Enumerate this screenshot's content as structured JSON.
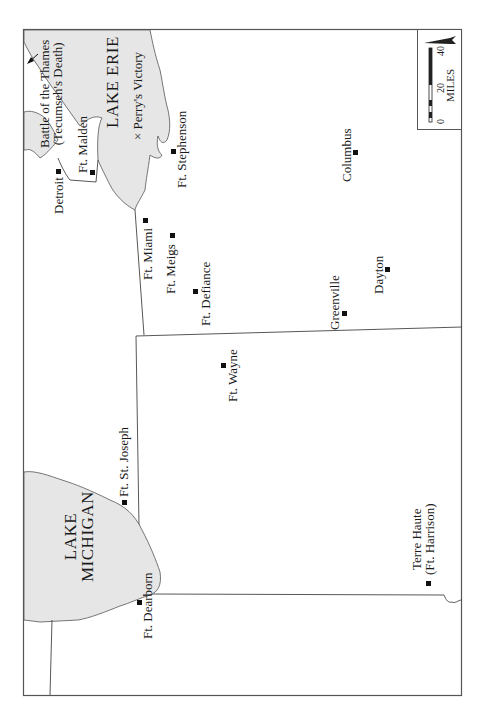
{
  "map": {
    "title": "War of 1812 - Northwest Theater",
    "colors": {
      "water": "#e6e6e6",
      "lines": "#444444",
      "frame": "#555555",
      "marker": "#111111"
    },
    "lakes": [
      {
        "id": "lake-erie",
        "label": "LAKE ERIE"
      },
      {
        "id": "lake-michigan",
        "label_line1": "LAKE",
        "label_line2": "MICHIGAN"
      }
    ],
    "places": [
      {
        "id": "detroit",
        "label": "Detroit"
      },
      {
        "id": "ft-malden",
        "label": "Ft. Malden"
      },
      {
        "id": "ft-stephenson",
        "label": "Ft. Stephenson"
      },
      {
        "id": "columbus",
        "label": "Columbus"
      },
      {
        "id": "ft-miami",
        "label": "Ft. Miami"
      },
      {
        "id": "ft-meigs",
        "label": "Ft. Meigs"
      },
      {
        "id": "ft-defiance",
        "label": "Ft. Defiance"
      },
      {
        "id": "greenville",
        "label": "Greenville"
      },
      {
        "id": "dayton",
        "label": "Dayton"
      },
      {
        "id": "ft-wayne",
        "label": "Ft. Wayne"
      },
      {
        "id": "ft-st-joseph",
        "label": "Ft. St. Joseph"
      },
      {
        "id": "ft-dearborn",
        "label": "Ft. Dearborn"
      },
      {
        "id": "terre-haute",
        "label_line1": "Terre Haute",
        "label_line2": "(Ft. Harrison)"
      }
    ],
    "battles": [
      {
        "id": "battle-thames",
        "label_line1": "Battle of the Thames",
        "label_line2": "(Tecumseh's Death)"
      },
      {
        "id": "perrys-victory",
        "label": "× Perry's Victory"
      }
    ],
    "scale": {
      "unit": "MILES",
      "ticks": [
        "0",
        "20",
        "40"
      ]
    },
    "north_arrow": "N"
  }
}
